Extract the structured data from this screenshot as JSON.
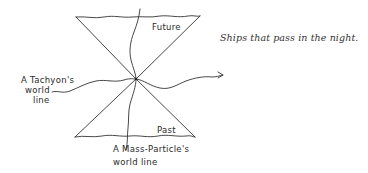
{
  "diagram": {
    "type": "spacetime light-cone diagram",
    "labels": {
      "future": "Future",
      "past": "Past",
      "tachyon_line_1": "A Tachyon's",
      "tachyon_line_2": "world",
      "tachyon_line_3": "line",
      "mass_particle_line_1": "A Mass-Particle's",
      "mass_particle_line_2": "world line"
    },
    "caption": "Ships that pass in the night.",
    "colors": {
      "ink": "#333333",
      "background": "#ffffff"
    }
  }
}
